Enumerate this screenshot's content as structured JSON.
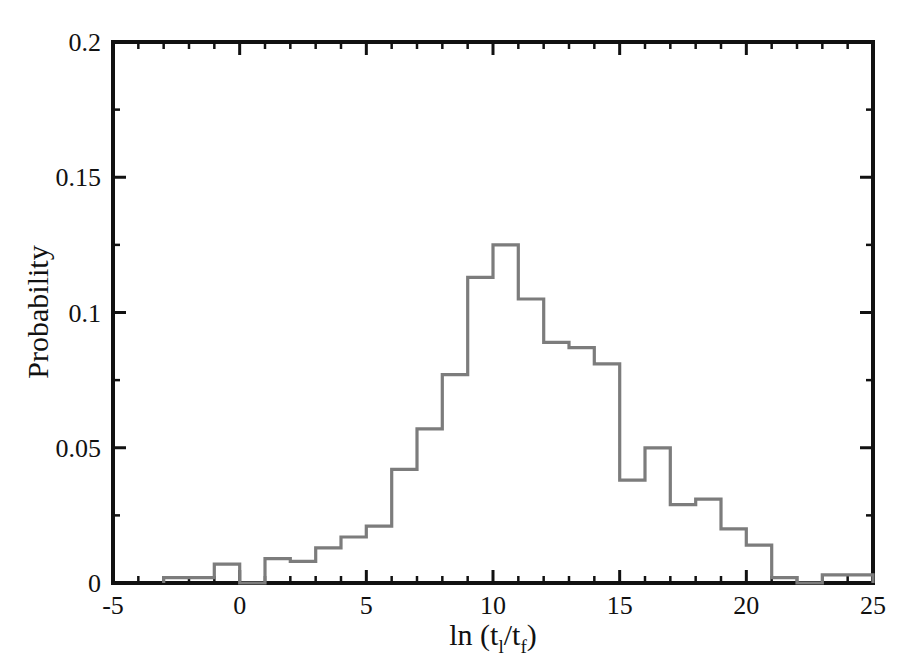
{
  "chart_data": {
    "type": "bar",
    "title": "",
    "subtitle": "",
    "xlabel": "ln (t_l/t_f)",
    "xlabel_parts": {
      "prefix": "ln (t",
      "sub1": "l",
      "mid": "/t",
      "sub2": "f",
      "suffix": ")"
    },
    "ylabel": "Probability",
    "xlim": [
      -5,
      25
    ],
    "ylim": [
      0,
      0.2
    ],
    "grid": false,
    "legend": null,
    "bin_width": 1,
    "xticks": [
      -5,
      0,
      5,
      10,
      15,
      20,
      25
    ],
    "xtick_labels": [
      "-5",
      "0",
      "5",
      "10",
      "15",
      "20",
      "25"
    ],
    "xminor_step": 1,
    "yticks": [
      0,
      0.05,
      0.1,
      0.15,
      0.2
    ],
    "ytick_labels": [
      "0",
      "0.05",
      "0.1",
      "0.15",
      "0.2"
    ],
    "yminor_step": 0.025,
    "bar_edge_color": "#7c7c7c",
    "bar_fill_color": "#ffffff",
    "axis_color": "#111111",
    "bin_edges": [
      -3,
      -2,
      -1,
      0,
      1,
      2,
      3,
      4,
      5,
      6,
      7,
      8,
      9,
      10,
      11,
      12,
      13,
      14,
      15,
      16,
      17,
      18,
      19,
      20,
      21,
      22,
      23,
      24,
      25
    ],
    "bin_left_edges": [
      -3,
      -2,
      -1,
      0,
      1,
      2,
      3,
      4,
      5,
      6,
      7,
      8,
      9,
      10,
      11,
      12,
      13,
      14,
      15,
      16,
      17,
      18,
      19,
      20,
      21,
      22,
      23,
      24
    ],
    "values": [
      0.002,
      0.002,
      0.007,
      0.0,
      0.009,
      0.008,
      0.013,
      0.017,
      0.021,
      0.042,
      0.057,
      0.077,
      0.113,
      0.125,
      0.105,
      0.089,
      0.087,
      0.081,
      0.038,
      0.05,
      0.029,
      0.031,
      0.02,
      0.014,
      0.002,
      0.0,
      0.003,
      0.003
    ],
    "peak": {
      "bin": "[10, 11)",
      "value": 0.125
    }
  },
  "figure": {
    "caption": ""
  }
}
